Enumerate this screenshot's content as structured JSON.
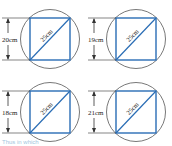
{
  "figures": [
    {
      "id": "a",
      "height_label": "20cm",
      "diagonal_label": "25cm"
    },
    {
      "id": "b",
      "height_label": "19cm",
      "diagonal_label": "25cm"
    },
    {
      "id": "c",
      "height_label": "18cm",
      "diagonal_label": "25cm"
    },
    {
      "id": "d",
      "height_label": "21cm",
      "diagonal_label": "25cm"
    }
  ],
  "footer_text": "Thus in which",
  "colors": {
    "square": "#2a6db5",
    "circle": "#555555",
    "dimension": "#333333"
  }
}
